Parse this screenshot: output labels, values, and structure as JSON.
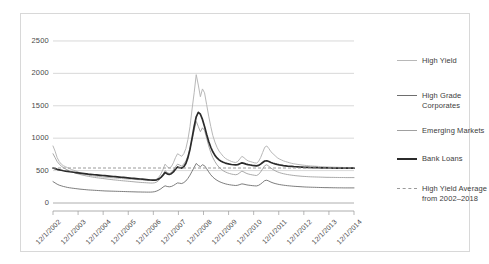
{
  "chart_data": {
    "type": "line",
    "title": "",
    "xlabel": "",
    "ylabel": "",
    "ylim": [
      0,
      2700
    ],
    "yticks": [
      0,
      500,
      1000,
      1500,
      2000,
      2500
    ],
    "ytick_labels": [
      "0",
      "500",
      "1000",
      "1500",
      "2000",
      "2500"
    ],
    "grid": true,
    "legend_position": "right",
    "xtick_labels": [
      "12/1/2002",
      "12/1/2003",
      "12/1/2004",
      "12/1/2005",
      "12/1/2006",
      "12/1/2007",
      "12/1/2008",
      "12/1/2009",
      "12/1/2010",
      "12/1/2011",
      "12/1/2012",
      "12/1/2013",
      "12/1/2014"
    ],
    "x_start": "12/1/2002",
    "x_end": "12/1/2014",
    "reference_line": {
      "label": "High Yield Average from 2002–2018",
      "value": 540,
      "style": "dashed",
      "color": "#9a9a9a"
    },
    "series": [
      {
        "name": "High Yield",
        "color": "#b8b8b8",
        "width": 1.0,
        "values": [
          880,
          800,
          700,
          640,
          600,
          575,
          560,
          545,
          530,
          515,
          505,
          495,
          480,
          465,
          455,
          450,
          440,
          430,
          425,
          420,
          415,
          412,
          408,
          405,
          400,
          398,
          395,
          392,
          390,
          388,
          385,
          382,
          380,
          378,
          375,
          372,
          370,
          368,
          366,
          364,
          362,
          360,
          358,
          356,
          355,
          354,
          353,
          352,
          352,
          355,
          370,
          400,
          450,
          520,
          600,
          560,
          540,
          560,
          620,
          700,
          760,
          740,
          720,
          760,
          840,
          980,
          1180,
          1450,
          1700,
          1980,
          1820,
          1640,
          1760,
          1700,
          1520,
          1340,
          1180,
          1040,
          940,
          860,
          800,
          760,
          720,
          690,
          670,
          655,
          640,
          630,
          625,
          640,
          680,
          720,
          700,
          670,
          650,
          640,
          630,
          620,
          615,
          640,
          700,
          780,
          860,
          880,
          840,
          790,
          760,
          730,
          700,
          680,
          665,
          650,
          640,
          630,
          620,
          612,
          605,
          600,
          595,
          590,
          586,
          582,
          578,
          575,
          572,
          570,
          568,
          566,
          564,
          562,
          560,
          558,
          556,
          555,
          554,
          553,
          552,
          551,
          550,
          549,
          548,
          548,
          548,
          548,
          548,
          548
        ]
      },
      {
        "name": "High Grade Corporates",
        "color": "#6e6e6e",
        "width": 0.9,
        "values": [
          330,
          310,
          290,
          275,
          265,
          255,
          248,
          240,
          235,
          230,
          226,
          222,
          218,
          214,
          211,
          208,
          205,
          202,
          200,
          198,
          196,
          194,
          192,
          190,
          188,
          186,
          185,
          184,
          183,
          182,
          181,
          180,
          179,
          178,
          177,
          176,
          175,
          174,
          173,
          172,
          171,
          170,
          170,
          169,
          169,
          168,
          168,
          168,
          170,
          175,
          185,
          200,
          220,
          245,
          265,
          255,
          250,
          255,
          270,
          290,
          310,
          305,
          300,
          315,
          340,
          380,
          430,
          490,
          550,
          610,
          580,
          560,
          590,
          575,
          530,
          480,
          435,
          400,
          372,
          350,
          332,
          318,
          306,
          296,
          288,
          282,
          277,
          273,
          270,
          274,
          285,
          295,
          290,
          282,
          276,
          272,
          268,
          265,
          263,
          272,
          292,
          318,
          345,
          352,
          338,
          322,
          310,
          300,
          292,
          285,
          280,
          275,
          271,
          267,
          264,
          261,
          258,
          256,
          254,
          252,
          250,
          248,
          246,
          245,
          244,
          243,
          242,
          241,
          240,
          239,
          238,
          237,
          237,
          236,
          236,
          235,
          235,
          234,
          234,
          234,
          233,
          233,
          233,
          233,
          233,
          233
        ]
      },
      {
        "name": "Emerging Markets",
        "color": "#a0a0a0",
        "width": 0.9,
        "values": [
          760,
          700,
          640,
          600,
          570,
          545,
          525,
          510,
          495,
          482,
          470,
          460,
          450,
          440,
          432,
          425,
          418,
          412,
          406,
          400,
          395,
          390,
          386,
          382,
          378,
          374,
          370,
          366,
          362,
          358,
          355,
          352,
          348,
          345,
          342,
          339,
          336,
          333,
          330,
          327,
          324,
          321,
          318,
          316,
          314,
          312,
          310,
          308,
          308,
          312,
          325,
          350,
          390,
          440,
          500,
          470,
          455,
          470,
          510,
          560,
          600,
          585,
          570,
          600,
          650,
          730,
          840,
          980,
          1120,
          1260,
          1180,
          1100,
          1160,
          1120,
          1000,
          880,
          780,
          700,
          640,
          590,
          552,
          522,
          498,
          480,
          466,
          455,
          446,
          440,
          436,
          444,
          468,
          492,
          478,
          460,
          448,
          440,
          434,
          428,
          424,
          440,
          478,
          528,
          576,
          590,
          566,
          538,
          516,
          498,
          482,
          470,
          460,
          452,
          445,
          439,
          434,
          429,
          425,
          421,
          418,
          415,
          412,
          410,
          408,
          406,
          404,
          403,
          402,
          401,
          400,
          399,
          398,
          397,
          396,
          396,
          395,
          395,
          394,
          394,
          393,
          393,
          393,
          392,
          392,
          392,
          392,
          392
        ]
      },
      {
        "name": "Bank Loans",
        "color": "#2b2b2b",
        "width": 1.7,
        "values": [
          540,
          530,
          520,
          512,
          505,
          498,
          492,
          487,
          482,
          478,
          474,
          470,
          466,
          462,
          458,
          454,
          450,
          446,
          443,
          440,
          436,
          433,
          430,
          427,
          424,
          421,
          418,
          415,
          412,
          409,
          406,
          403,
          400,
          397,
          394,
          391,
          388,
          385,
          382,
          379,
          376,
          373,
          370,
          367,
          364,
          361,
          358,
          355,
          352,
          352,
          358,
          372,
          396,
          430,
          470,
          450,
          440,
          452,
          480,
          520,
          556,
          545,
          538,
          560,
          610,
          700,
          830,
          1000,
          1180,
          1330,
          1400,
          1370,
          1290,
          1180,
          1060,
          950,
          860,
          790,
          735,
          695,
          665,
          645,
          628,
          616,
          607,
          600,
          594,
          590,
          587,
          592,
          606,
          620,
          612,
          600,
          592,
          586,
          580,
          576,
          572,
          580,
          600,
          625,
          648,
          652,
          640,
          626,
          614,
          604,
          596,
          589,
          583,
          578,
          574,
          570,
          567,
          564,
          561,
          559,
          557,
          555,
          553,
          551,
          550,
          549,
          548,
          547,
          546,
          545,
          544,
          543,
          542,
          541,
          541,
          540,
          540,
          539,
          539,
          538,
          538,
          538,
          537,
          537,
          537,
          537,
          537,
          537
        ]
      }
    ]
  },
  "legend": {
    "items": [
      {
        "label": "High Yield",
        "color": "#b8b8b8",
        "style": "solid",
        "width": 1.3
      },
      {
        "label": "High Grade\nCorporates",
        "color": "#6e6e6e",
        "style": "solid",
        "width": 1.3
      },
      {
        "label": "Emerging Markets",
        "color": "#a0a0a0",
        "style": "solid",
        "width": 1.3
      },
      {
        "label": "Bank Loans",
        "color": "#2b2b2b",
        "style": "solid",
        "width": 2.4
      },
      {
        "label": "High Yield Average\nfrom 2002–2018",
        "color": "#9a9a9a",
        "style": "dashed",
        "width": 1.2
      }
    ]
  },
  "colors": {
    "background": "#ffffff",
    "frame": "#d8d8d8",
    "gridline": "#c9c9c9",
    "axis": "#9a9a9a",
    "text": "#4a4a4a"
  }
}
